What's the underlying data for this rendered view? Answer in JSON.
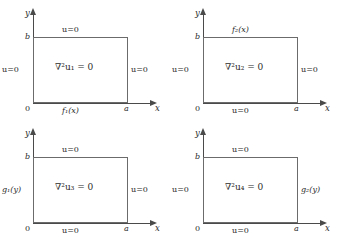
{
  "figure": {
    "type": "diagram",
    "axis": {
      "x_label": "x",
      "y_label": "y",
      "origin_label": "0",
      "x_tick_label": "a",
      "y_tick_label": "b"
    },
    "panels": [
      {
        "id": "panel-1",
        "interior": "∇²u₁ = 0",
        "interior_symbol": "∇²",
        "interior_u": "u",
        "interior_index": "1",
        "top": "u=0",
        "bottom": "f₁(x)",
        "left": "u=0",
        "right": "u=0",
        "bottom_is_function": true,
        "left_is_function": false,
        "right_is_function": false,
        "top_is_function": false
      },
      {
        "id": "panel-2",
        "interior": "∇²u₂ = 0",
        "interior_symbol": "∇²",
        "interior_u": "u",
        "interior_index": "2",
        "top": "f₂(x)",
        "bottom": "u=0",
        "left": "u=0",
        "right": "u=0",
        "bottom_is_function": false,
        "left_is_function": false,
        "right_is_function": false,
        "top_is_function": true
      },
      {
        "id": "panel-3",
        "interior": "∇²u₃ = 0",
        "interior_symbol": "∇²",
        "interior_u": "u",
        "interior_index": "3",
        "top": "u=0",
        "bottom": "u=0",
        "left": "g₁(y)",
        "right": "u=0",
        "bottom_is_function": false,
        "left_is_function": true,
        "right_is_function": false,
        "top_is_function": false
      },
      {
        "id": "panel-4",
        "interior": "∇²u₄ = 0",
        "interior_symbol": "∇²",
        "interior_u": "u",
        "interior_index": "4",
        "top": "u=0",
        "bottom": "u=0",
        "left": "u=0",
        "right": "g₂(y)",
        "bottom_is_function": false,
        "left_is_function": false,
        "right_is_function": false,
        "top_is_function": false
      }
    ],
    "colors": {
      "axis": "#4a4a4a",
      "rect_border": "#6b6b6b",
      "text": "#2b2b2b",
      "background": "#ffffff"
    }
  }
}
